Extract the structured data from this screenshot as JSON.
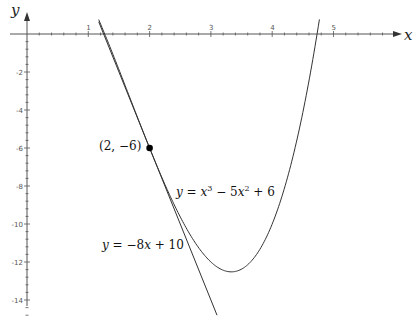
{
  "chart_data": {
    "type": "line",
    "title": "",
    "xlabel": "x",
    "ylabel": "y",
    "xlim": [
      0,
      5.8
    ],
    "ylim": [
      -15,
      1
    ],
    "x_ticks": [
      1,
      2,
      3,
      4,
      5
    ],
    "y_ticks": [
      -2,
      -4,
      -6,
      -8,
      -10,
      -12,
      -14
    ],
    "x_minor_step": 0.2,
    "y_minor_step": 0.4,
    "grid": false,
    "series": [
      {
        "name": "y = x^3 - 5x^2 + 6",
        "expression": "x^3 - 5x^2 + 6",
        "x_range": [
          1.17,
          4.77
        ],
        "sample_points": [
          {
            "x": 1.2,
            "y": 0.528
          },
          {
            "x": 1.5,
            "y": -1.875
          },
          {
            "x": 2.0,
            "y": -6
          },
          {
            "x": 2.5,
            "y": -9.625
          },
          {
            "x": 3.0,
            "y": -12
          },
          {
            "x": 3.333,
            "y": -12.52
          },
          {
            "x": 3.5,
            "y": -12.375
          },
          {
            "x": 4.0,
            "y": -10
          },
          {
            "x": 4.5,
            "y": -4.125
          },
          {
            "x": 4.73,
            "y": 0
          }
        ]
      },
      {
        "name": "y = -8x + 10",
        "expression": "-8x + 10",
        "x_range": [
          1.17,
          3.1
        ],
        "sample_points": [
          {
            "x": 1.17,
            "y": 0.64
          },
          {
            "x": 2.0,
            "y": -6
          },
          {
            "x": 3.1,
            "y": -14.8
          }
        ]
      }
    ],
    "points": [
      {
        "x": 2,
        "y": -6,
        "label": "(2, −6)"
      }
    ],
    "annotations": [
      {
        "text_parts": [
          "y",
          " = ",
          "x",
          "3",
          " − 5",
          "x",
          "2",
          " + 6"
        ],
        "anchor": {
          "x": 2.45,
          "y": -10.4
        }
      },
      {
        "text_parts": [
          "y",
          " = −8",
          "x",
          " + 10"
        ],
        "anchor": {
          "x": 1.22,
          "y": -13.8
        }
      }
    ]
  },
  "labels": {
    "x_axis": "x",
    "y_axis": "y",
    "point": "(2, −6)",
    "cubic": {
      "y": "y",
      "eq": " = ",
      "x1": "x",
      "p1": "3",
      "mid": " − 5",
      "x2": "x",
      "p2": "2",
      "end": " + 6"
    },
    "tangent": {
      "y": "y",
      "eq": " = −8",
      "x": "x",
      "end": " + 10"
    }
  }
}
